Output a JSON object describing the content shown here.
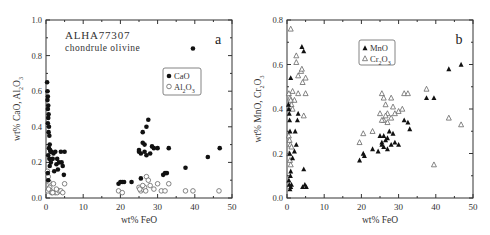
{
  "chart_data": [
    {
      "type": "scatter",
      "panel_label": "a",
      "title_lines": [
        "ALHA77307",
        "chondrule olivine"
      ],
      "xlabel": "wt% FeO",
      "ylabel": "wt% CaO, Al2O3",
      "xlim": [
        0,
        50
      ],
      "ylim": [
        0,
        1.0
      ],
      "xticks": [
        0,
        10,
        20,
        30,
        40,
        50
      ],
      "yticks": [
        0.0,
        0.2,
        0.4,
        0.6,
        0.8,
        1.0
      ],
      "yticklabels": [
        "0.0",
        "0.2",
        "0.4",
        "0.6",
        "0.8",
        "1.0"
      ],
      "legend": [
        "CaO",
        "Al2O3"
      ],
      "series": [
        {
          "name": "CaO",
          "marker": "filled-circle",
          "x": [
            0.3,
            0.4,
            0.5,
            0.4,
            0.6,
            0.5,
            0.7,
            0.6,
            0.5,
            0.8,
            0.7,
            0.9,
            1.0,
            0.8,
            1.1,
            1.2,
            0.6,
            0.9,
            1.3,
            1.0,
            1.5,
            2.0,
            2.5,
            3.0,
            3.5,
            4.0,
            4.5,
            5.0,
            2.2,
            3.2,
            4.2,
            4.8,
            1.8,
            2.8,
            0.5,
            0.6,
            19.5,
            20.0,
            20.5,
            21.0,
            23.0,
            25.5,
            25.0,
            26.0,
            26.5,
            27.0,
            27.5,
            26.0,
            25.0,
            28.0,
            28.5,
            29.0,
            30.0,
            27.0,
            26.5,
            25.5,
            33.0,
            31.5,
            32.0,
            32.5,
            37.5,
            39.5,
            43.5,
            46.7
          ],
          "y": [
            0.65,
            0.6,
            0.57,
            0.55,
            0.52,
            0.5,
            0.47,
            0.45,
            0.42,
            0.4,
            0.37,
            0.35,
            0.3,
            0.28,
            0.27,
            0.26,
            0.24,
            0.22,
            0.2,
            0.18,
            0.26,
            0.25,
            0.26,
            0.22,
            0.2,
            0.26,
            0.18,
            0.26,
            0.15,
            0.16,
            0.2,
            0.13,
            0.22,
            0.19,
            0.14,
            0.1,
            0.08,
            0.09,
            0.09,
            0.09,
            0.09,
            0.11,
            0.27,
            0.37,
            0.3,
            0.4,
            0.44,
            0.31,
            0.26,
            0.25,
            0.29,
            0.28,
            0.28,
            0.24,
            0.26,
            0.25,
            0.28,
            0.13,
            0.14,
            0.14,
            0.17,
            0.84,
            0.23,
            0.28
          ]
        },
        {
          "name": "Al2O3",
          "marker": "open-circle",
          "x": [
            0.4,
            0.6,
            0.8,
            1.0,
            1.2,
            0.5,
            0.7,
            1.5,
            2.0,
            2.5,
            3.0,
            3.5,
            4.0,
            4.5,
            5.0,
            1.8,
            2.8,
            19.5,
            20.5,
            25.0,
            25.5,
            26.0,
            26.5,
            27.0,
            27.5,
            26.0,
            28.0,
            29.0,
            30.0,
            31.0,
            32.0,
            33.0,
            37.5,
            39.5,
            46.5,
            25.2,
            26.8
          ],
          "y": [
            0.15,
            0.12,
            0.09,
            0.06,
            0.04,
            0.04,
            0.05,
            0.03,
            0.08,
            0.03,
            0.03,
            0.04,
            0.04,
            0.03,
            0.08,
            0.03,
            0.05,
            0.04,
            0.03,
            0.06,
            0.04,
            0.05,
            0.06,
            0.12,
            0.1,
            0.07,
            0.07,
            0.05,
            0.08,
            0.04,
            0.04,
            0.08,
            0.04,
            0.04,
            0.04,
            0.05,
            0.04
          ]
        }
      ]
    },
    {
      "type": "scatter",
      "panel_label": "b",
      "xlabel": "wt% FeO",
      "ylabel": "wt% MnO, Cr2O3",
      "xlim": [
        0,
        50
      ],
      "ylim": [
        0,
        0.8
      ],
      "xticks": [
        0,
        10,
        20,
        30,
        40,
        50
      ],
      "yticks": [
        0.0,
        0.2,
        0.4,
        0.6,
        0.8
      ],
      "yticklabels": [
        "0.0",
        "0.2",
        "0.4",
        "0.6",
        "0.8"
      ],
      "legend": [
        "MnO",
        "Cr2O3"
      ],
      "series": [
        {
          "name": "MnO",
          "marker": "filled-triangle",
          "x": [
            0.4,
            0.5,
            0.6,
            0.7,
            0.8,
            0.5,
            0.6,
            0.9,
            1.0,
            1.2,
            1.5,
            2.0,
            2.5,
            3.0,
            2.8,
            2.2,
            1.0,
            0.8,
            4.0,
            4.5,
            4.8,
            4.2,
            4.5,
            5.2,
            1.0,
            0.7,
            19.5,
            20.5,
            20.8,
            23.0,
            24.5,
            25.0,
            25.5,
            26.0,
            26.5,
            27.0,
            27.5,
            28.0,
            28.5,
            26.0,
            25.5,
            27.0,
            29.0,
            30.0,
            31.5,
            32.5,
            33.0,
            37.5,
            39.5,
            43.5,
            46.8
          ],
          "y": [
            0.42,
            0.4,
            0.38,
            0.35,
            0.3,
            0.08,
            0.06,
            0.1,
            0.05,
            0.06,
            0.18,
            0.21,
            0.24,
            0.38,
            0.35,
            0.3,
            0.54,
            0.04,
            0.68,
            0.66,
            0.06,
            0.05,
            0.13,
            0.05,
            0.12,
            0.2,
            0.17,
            0.2,
            0.19,
            0.22,
            0.21,
            0.28,
            0.25,
            0.23,
            0.26,
            0.27,
            0.3,
            0.24,
            0.29,
            0.28,
            0.24,
            0.22,
            0.25,
            0.24,
            0.35,
            0.34,
            0.31,
            0.45,
            0.45,
            0.58,
            0.6
          ]
        },
        {
          "name": "Cr2O3",
          "marker": "open-triangle",
          "x": [
            1.0,
            2.5,
            2.5,
            3.0,
            3.8,
            4.0,
            4.2,
            5.0,
            1.5,
            2.0,
            3.0,
            5.0,
            0.5,
            0.8,
            1.0,
            1.2,
            1.5,
            4.5,
            0.5,
            0.7,
            0.9,
            1.2,
            0.6,
            0.8,
            1.0,
            19.5,
            20.5,
            23.0,
            25.0,
            25.5,
            26.0,
            26.5,
            27.0,
            28.0,
            28.5,
            29.0,
            30.0,
            31.0,
            31.5,
            32.5,
            26.0,
            27.0,
            28.0,
            25.5,
            26.5,
            37.5,
            43.5,
            46.8,
            39.5
          ],
          "y": [
            0.76,
            0.64,
            0.61,
            0.55,
            0.57,
            0.58,
            0.52,
            0.54,
            0.48,
            0.44,
            0.47,
            0.47,
            0.47,
            0.45,
            0.44,
            0.42,
            0.4,
            0.37,
            0.28,
            0.26,
            0.24,
            0.23,
            0.2,
            0.17,
            0.15,
            0.25,
            0.29,
            0.3,
            0.38,
            0.47,
            0.45,
            0.42,
            0.38,
            0.45,
            0.41,
            0.38,
            0.39,
            0.4,
            0.47,
            0.47,
            0.35,
            0.34,
            0.36,
            0.35,
            0.37,
            0.49,
            0.36,
            0.33,
            0.15
          ]
        }
      ]
    }
  ]
}
